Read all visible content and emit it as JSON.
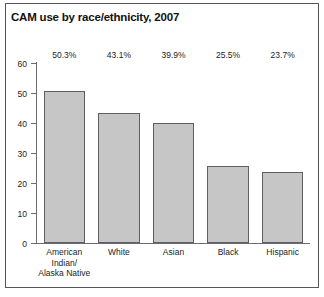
{
  "chart_data": {
    "type": "bar",
    "title": "CAM use by race/ethnicity, 2007",
    "xlabel": "",
    "ylabel": "",
    "ylim": [
      0,
      60
    ],
    "yticks": [
      0,
      10,
      20,
      30,
      40,
      50,
      60
    ],
    "grid": false,
    "legend": null,
    "categories": [
      "American Indian/ Alaska Native",
      "White",
      "Asian",
      "Black",
      "Hispanic"
    ],
    "category_lines": [
      [
        "American",
        "Indian/",
        "Alaska Native"
      ],
      [
        "White"
      ],
      [
        "Asian"
      ],
      [
        "Black"
      ],
      [
        "Hispanic"
      ]
    ],
    "values": [
      50.3,
      43.1,
      39.9,
      25.5,
      23.7
    ],
    "data_labels": [
      "50.3%",
      "43.1%",
      "39.9%",
      "25.5%",
      "23.7%"
    ],
    "colors": {
      "bar_fill": "#c6c6c6",
      "bar_border": "#5e5f63",
      "axis": "#6b6c70",
      "text": "#1c1c1c",
      "frame": "#55565a",
      "background": "#ffffff"
    }
  },
  "caption": ""
}
